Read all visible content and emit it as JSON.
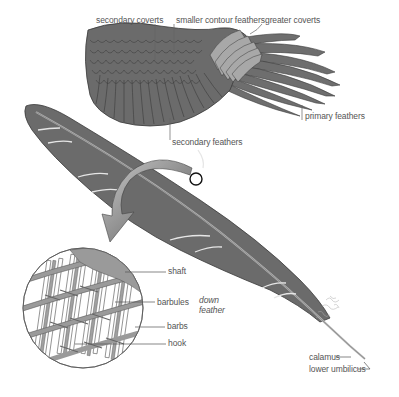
{
  "diagram": {
    "colors": {
      "feather_dark": "#6b6b6b",
      "feather_outline": "#3a3a3a",
      "coverts_light": "#a8a8a8",
      "shaft": "#b5b5b5",
      "arrow": "#7a7a7a",
      "magnifier_fill": "#9a9a9a",
      "label_text": "#555555",
      "leader_line": "#666666",
      "background": "#ffffff"
    },
    "wing_labels": {
      "secondary_coverts": "secondary coverts",
      "smaller_contour_feathers": "smaller contour feathers",
      "greater_coverts": "greater coverts",
      "primary_feathers": "primary feathers",
      "secondary_feathers": "secondary feathers"
    },
    "detail_labels": {
      "shaft": "shaft",
      "barbules": "barbules",
      "barbs": "barbs",
      "hook": "hook"
    },
    "feather_labels": {
      "down_feather_line1": "down",
      "down_feather_line2": "feather",
      "calamus": "calamus",
      "lower_umbilicus": "lower umbilicus"
    }
  }
}
